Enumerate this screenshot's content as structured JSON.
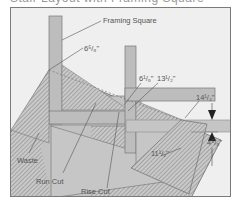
{
  "diagram": {
    "cropped_header": "Stair Layout with Framing Square",
    "labels": {
      "framing_square": "Framing Square",
      "dim_6_5_8": "6⁵/₈\"",
      "dim_6_1_8": "6¹/₈\"",
      "dim_13_1_2": "13¹/₂\"",
      "dim_14_1_2": "14¹/₂\"",
      "dim_11_1_2": "11¹/₂\"",
      "dim_4_5_8": "4⁵/₈\"",
      "waste": "Waste",
      "run_cut": "Run Cut",
      "rise_cut": "Rise Cut"
    },
    "colors": {
      "background": "#efefef",
      "board": "#c8c8c8",
      "square": "#b9b9b9",
      "hatch": "#8a8a8a",
      "outline": "#6f6f6f",
      "text": "#555555"
    }
  }
}
